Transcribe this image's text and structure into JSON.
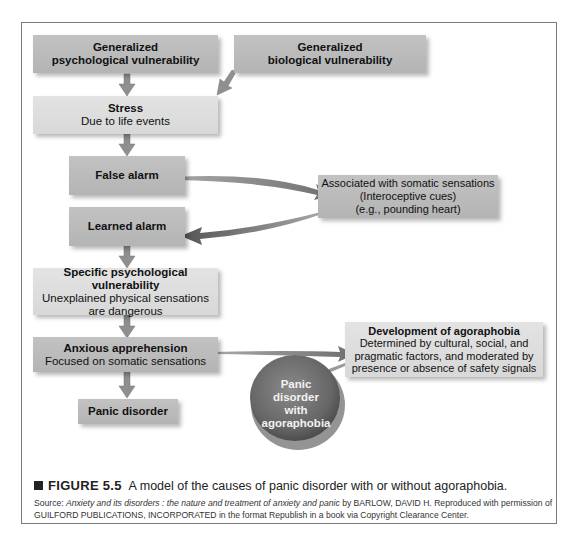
{
  "diagram": {
    "nodes": {
      "gen_psych": {
        "title": "Generalized",
        "subtitle": "psychological vulnerability"
      },
      "gen_bio": {
        "title": "Generalized",
        "subtitle": "biological vulnerability"
      },
      "stress": {
        "title": "Stress",
        "subtitle": "Due to life events"
      },
      "false_alarm": {
        "title": "False alarm"
      },
      "learned_alarm": {
        "title": "Learned alarm"
      },
      "somatic": {
        "line1": "Associated with somatic sensations",
        "line2": "(Interoceptive cues)",
        "line3": "(e.g., pounding heart)"
      },
      "specific_psych": {
        "title": "Specific psychological vulnerability",
        "line1": "Unexplained physical sensations",
        "line2": "are dangerous"
      },
      "anxious": {
        "title": "Anxious apprehension",
        "subtitle": "Focused on somatic sensations"
      },
      "panic": {
        "title": "Panic disorder"
      },
      "agoraphobia": {
        "title": "Development of agoraphobia",
        "line1": "Determined by cultural, social, and",
        "line2": "pragmatic factors, and moderated by",
        "line3": "presence or absence of safety signals"
      },
      "panic_agora": {
        "line1": "Panic",
        "line2": "disorder",
        "line3": "with",
        "line4": "agoraphobia"
      }
    },
    "edges": [
      {
        "from": "gen_psych",
        "to": "stress"
      },
      {
        "from": "gen_bio",
        "to": "stress"
      },
      {
        "from": "stress",
        "to": "false_alarm"
      },
      {
        "from": "false_alarm",
        "to": "somatic"
      },
      {
        "from": "somatic",
        "to": "learned_alarm"
      },
      {
        "from": "learned_alarm",
        "to": "specific_psych"
      },
      {
        "from": "specific_psych",
        "to": "anxious"
      },
      {
        "from": "anxious",
        "to": "panic"
      },
      {
        "from": "anxious",
        "to": "agoraphobia"
      },
      {
        "from": "agoraphobia",
        "to": "panic_agora"
      }
    ],
    "colors": {
      "dark_box": "#bcbcbc",
      "light_box": "#dedede",
      "arrow": "#8a8a8a",
      "circle": "#6e6e6e"
    }
  },
  "caption": {
    "figure_label": "FIGURE 5.5",
    "text": "A model of the causes of panic disorder with or without agoraphobia."
  },
  "source": {
    "prefix": "Source: ",
    "title": "Anxiety and its disorders : the nature and treatment of anxiety and panic",
    "rest": " by BARLOW, DAVID H. Reproduced with permission of GUILFORD PUBLICATIONS, INCORPORATED in the format Republish in a book via Copyright Clearance Center."
  }
}
